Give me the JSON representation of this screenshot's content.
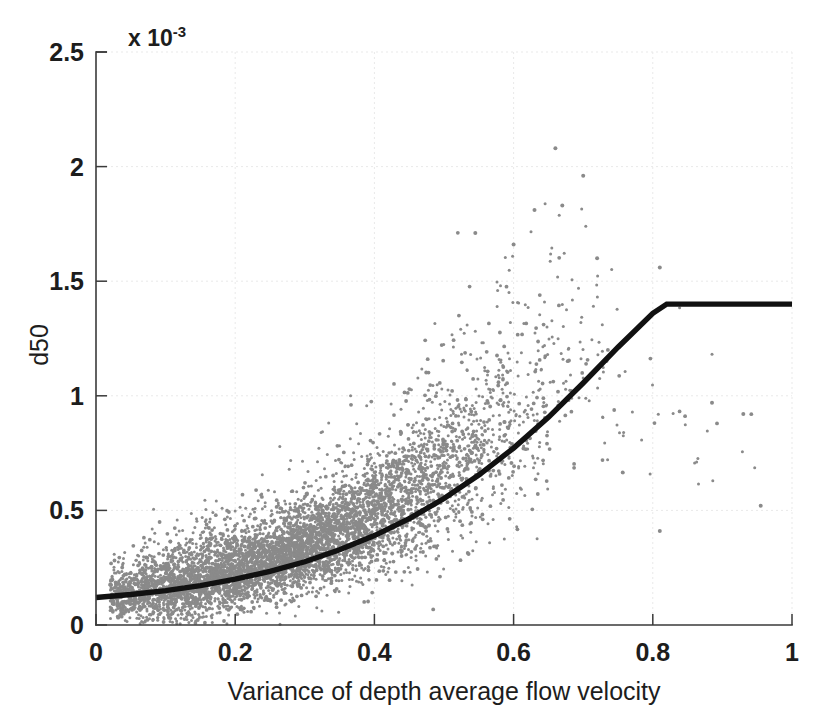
{
  "figure": {
    "background_color": "#ffffff",
    "axis_color": "#3a3a3a",
    "scatter_color": "#8a8a8a",
    "curve_color": "#111111"
  },
  "axes": {
    "y_exponent_prefix": "x 10",
    "y_exponent_power": "-3",
    "y_title": "d50",
    "x_title": "Variance of depth average flow velocity",
    "x_ticks": [
      "0",
      "0.2",
      "0.4",
      "0.6",
      "0.8",
      "1"
    ],
    "y_ticks": [
      "0",
      "0.5",
      "1",
      "1.5",
      "2",
      "2.5"
    ]
  },
  "chart_data": {
    "type": "scatter",
    "title": "",
    "subtitle": "",
    "xlabel": "Variance of depth average flow velocity",
    "ylabel": "d50",
    "y_scale_factor": "1e-3",
    "y_scale_label": "x 10^-3",
    "xlim": [
      0,
      1
    ],
    "ylim": [
      0,
      0.0025
    ],
    "xticks": [
      0,
      0.2,
      0.4,
      0.6,
      0.8,
      1
    ],
    "yticks": [
      0,
      0.0005,
      0.001,
      0.0015,
      0.002,
      0.0025
    ],
    "grid": "faint-dotted",
    "legend": "none",
    "series": [
      {
        "name": "observed d50 samples",
        "type": "scatter",
        "marker": "point",
        "color": "#8a8a8a",
        "point_count_approx": 6000,
        "description": "Dense gray cloud rising from near-zero at x=0 to a broad band; core band follows the fitted curve with increasing vertical spread; sparse outliers above 1.5e-3 between x=0.55 and x=0.72; scattered isolated points between x=0.75 and x=1.",
        "density_profile": [
          {
            "x": 0.02,
            "core_center": 0.00012,
            "spread": 7e-05,
            "weight": 0.02
          },
          {
            "x": 0.06,
            "core_center": 0.00014,
            "spread": 0.0001,
            "weight": 0.05
          },
          {
            "x": 0.1,
            "core_center": 0.00016,
            "spread": 0.00012,
            "weight": 0.08
          },
          {
            "x": 0.15,
            "core_center": 0.00019,
            "spread": 0.00013,
            "weight": 0.1
          },
          {
            "x": 0.2,
            "core_center": 0.00023,
            "spread": 0.00013,
            "weight": 0.11
          },
          {
            "x": 0.25,
            "core_center": 0.00027,
            "spread": 0.00014,
            "weight": 0.11
          },
          {
            "x": 0.3,
            "core_center": 0.00032,
            "spread": 0.00015,
            "weight": 0.11
          },
          {
            "x": 0.35,
            "core_center": 0.00039,
            "spread": 0.00017,
            "weight": 0.1
          },
          {
            "x": 0.4,
            "core_center": 0.00047,
            "spread": 0.0002,
            "weight": 0.09
          },
          {
            "x": 0.45,
            "core_center": 0.00056,
            "spread": 0.00024,
            "weight": 0.07
          },
          {
            "x": 0.5,
            "core_center": 0.00066,
            "spread": 0.00028,
            "weight": 0.05
          },
          {
            "x": 0.55,
            "core_center": 0.00078,
            "spread": 0.00032,
            "weight": 0.035
          },
          {
            "x": 0.6,
            "core_center": 0.0009,
            "spread": 0.00036,
            "weight": 0.022
          },
          {
            "x": 0.65,
            "core_center": 0.00104,
            "spread": 0.00038,
            "weight": 0.013
          },
          {
            "x": 0.7,
            "core_center": 0.00115,
            "spread": 0.00036,
            "weight": 0.007
          },
          {
            "x": 0.75,
            "core_center": 0.00095,
            "spread": 0.0003,
            "weight": 0.003
          },
          {
            "x": 0.8,
            "core_center": 0.0009,
            "spread": 0.00028,
            "weight": 0.002
          },
          {
            "x": 0.88,
            "core_center": 0.00085,
            "spread": 0.00025,
            "weight": 0.0012
          },
          {
            "x": 0.95,
            "core_center": 0.00075,
            "spread": 0.00025,
            "weight": 0.0008
          }
        ],
        "notable_outliers": [
          {
            "x": 0.66,
            "y": 0.00208
          },
          {
            "x": 0.7,
            "y": 0.00196
          },
          {
            "x": 0.67,
            "y": 0.00183
          },
          {
            "x": 0.63,
            "y": 0.00181
          },
          {
            "x": 0.545,
            "y": 0.00171
          },
          {
            "x": 0.6,
            "y": 0.00166
          },
          {
            "x": 0.72,
            "y": 0.0016
          },
          {
            "x": 0.81,
            "y": 0.00156
          },
          {
            "x": 0.885,
            "y": 0.00097
          },
          {
            "x": 0.93,
            "y": 0.00092
          },
          {
            "x": 0.955,
            "y": 0.00052
          },
          {
            "x": 0.81,
            "y": 0.00041
          }
        ]
      },
      {
        "name": "fitted relationship",
        "type": "line",
        "color": "#111111",
        "line_width": 5.4,
        "description": "Smooth monotonically increasing curve from 0.12e-3 at x=0, convex upward, reaching a plateau knee at about x=0.82, y=1.40e-3, then flat at 1.40e-3 to x=1.",
        "knee": {
          "x": 0.82,
          "y": 0.0014
        },
        "plateau_value": 0.0014,
        "points": [
          {
            "x": 0.0,
            "y": 0.00012
          },
          {
            "x": 0.05,
            "y": 0.000133
          },
          {
            "x": 0.1,
            "y": 0.00015
          },
          {
            "x": 0.15,
            "y": 0.000172
          },
          {
            "x": 0.2,
            "y": 0.0002
          },
          {
            "x": 0.25,
            "y": 0.000234
          },
          {
            "x": 0.3,
            "y": 0.000276
          },
          {
            "x": 0.35,
            "y": 0.000328
          },
          {
            "x": 0.4,
            "y": 0.00039
          },
          {
            "x": 0.45,
            "y": 0.000464
          },
          {
            "x": 0.5,
            "y": 0.000552
          },
          {
            "x": 0.55,
            "y": 0.000654
          },
          {
            "x": 0.6,
            "y": 0.000772
          },
          {
            "x": 0.65,
            "y": 0.000906
          },
          {
            "x": 0.7,
            "y": 0.001056
          },
          {
            "x": 0.75,
            "y": 0.001212
          },
          {
            "x": 0.8,
            "y": 0.00136
          },
          {
            "x": 0.82,
            "y": 0.0014
          },
          {
            "x": 0.9,
            "y": 0.0014
          },
          {
            "x": 1.0,
            "y": 0.0014
          }
        ]
      }
    ]
  }
}
